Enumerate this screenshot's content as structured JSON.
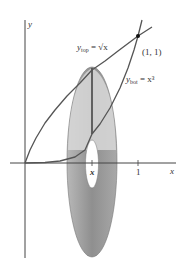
{
  "figure": {
    "axes": {
      "x_label": "x",
      "y_label": "y"
    },
    "ticks": {
      "x_var": "x",
      "one": "1"
    },
    "curves": {
      "top": {
        "label_main": "y",
        "label_sub": "top",
        "label_rest": " = √x",
        "equation": "y_top = sqrt(x)"
      },
      "bottom": {
        "label_main": "y",
        "label_sub": "bot",
        "label_rest": " = x³",
        "equation": "y_bot = x^3"
      }
    },
    "point": {
      "label": "(1, 1)"
    },
    "colors": {
      "curve": "#555555",
      "washer_outer": "#9a9a9a",
      "washer_light": "#d6d6d6",
      "axis": "#444444"
    }
  }
}
